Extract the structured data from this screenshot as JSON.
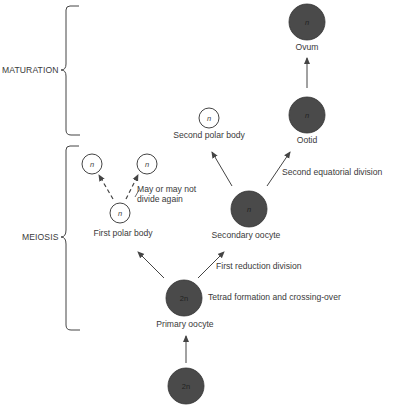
{
  "phases": {
    "maturation": "MATURATION",
    "meiosis": "MEIOSIS"
  },
  "cells": {
    "ovum": {
      "ploidy": "n",
      "label": "Ovum"
    },
    "ootid": {
      "ploidy": "n",
      "label": "Ootid"
    },
    "second_polar_body": {
      "ploidy": "n",
      "label": "Second polar body"
    },
    "secondary_oocyte": {
      "ploidy": "n",
      "label": "Secondary oocyte"
    },
    "first_polar_body": {
      "ploidy": "n",
      "label": "First polar body"
    },
    "polar_daughter_left": {
      "ploidy": "n"
    },
    "polar_daughter_right": {
      "ploidy": "n"
    },
    "primary_oocyte": {
      "ploidy": "2n",
      "label": "Primary oocyte"
    },
    "oogonium": {
      "ploidy": "2n"
    }
  },
  "annotations": {
    "may_divide_line1": "May or may not",
    "may_divide_line2": "divide again",
    "second_division": "Second equatorial division",
    "first_division": "First reduction division",
    "tetrad": "Tetrad formation and crossing-over"
  },
  "colors": {
    "cell_fill": "#4a4a4a",
    "line": "#444444",
    "text": "#3a3a3a"
  }
}
